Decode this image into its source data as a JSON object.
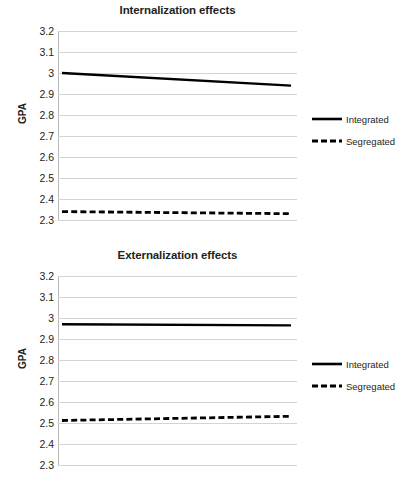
{
  "figure": {
    "ylabel": "GPA",
    "legend": {
      "integrated": "Integrated",
      "segregated": "Segregated"
    }
  },
  "chart_data": [
    {
      "type": "line",
      "title": "Internalization effects",
      "xlabel": "",
      "ylabel": "GPA",
      "ylim": [
        2.3,
        3.2
      ],
      "yticks": [
        "3.2",
        "3.1",
        "3",
        "2.9",
        "2.8",
        "2.7",
        "2.6",
        "2.5",
        "2.4",
        "2.3"
      ],
      "ytick_values": [
        3.2,
        3.1,
        3.0,
        2.9,
        2.8,
        2.7,
        2.6,
        2.5,
        2.4,
        2.3
      ],
      "grid": true,
      "legend_position": "right",
      "x": [
        0,
        1
      ],
      "series": [
        {
          "name": "Integrated",
          "style": "solid",
          "color": "#000000",
          "values": [
            3.0,
            2.94
          ]
        },
        {
          "name": "Segregated",
          "style": "dashed",
          "color": "#000000",
          "values": [
            2.34,
            2.33
          ]
        }
      ]
    },
    {
      "type": "line",
      "title": "Externalization effects",
      "xlabel": "",
      "ylabel": "GPA",
      "ylim": [
        2.3,
        3.2
      ],
      "yticks": [
        "3.2",
        "3.1",
        "3",
        "2.9",
        "2.8",
        "2.7",
        "2.6",
        "2.5",
        "2.4",
        "2.3"
      ],
      "ytick_values": [
        3.2,
        3.1,
        3.0,
        2.9,
        2.8,
        2.7,
        2.6,
        2.5,
        2.4,
        2.3
      ],
      "grid": true,
      "legend_position": "right",
      "x": [
        0,
        1
      ],
      "series": [
        {
          "name": "Integrated",
          "style": "solid",
          "color": "#000000",
          "values": [
            2.97,
            2.965
          ]
        },
        {
          "name": "Segregated",
          "style": "dashed",
          "color": "#000000",
          "values": [
            2.512,
            2.532
          ]
        }
      ]
    }
  ]
}
